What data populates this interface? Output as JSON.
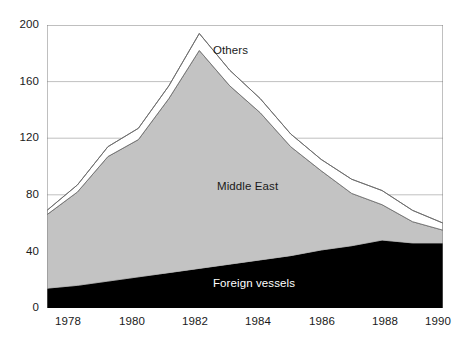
{
  "chart_data": {
    "type": "area",
    "stacked": true,
    "title": "",
    "subtitle": "",
    "xlabel": "",
    "ylabel": "",
    "xlim": [
      1977,
      1990
    ],
    "ylim": [
      0,
      200
    ],
    "yticks": [
      0,
      40,
      80,
      120,
      160,
      200
    ],
    "xticks": [
      1978,
      1980,
      1982,
      1984,
      1986,
      1988,
      1990
    ],
    "grid": true,
    "grid_axis": "y",
    "legend_position": "inline-annotations",
    "x": [
      1977,
      1978,
      1979,
      1980,
      1981,
      1982,
      1983,
      1984,
      1985,
      1986,
      1987,
      1988,
      1989,
      1990
    ],
    "series": [
      {
        "name": "Foreign vessels",
        "color": "#000000",
        "values": [
          14,
          16,
          19,
          22,
          25,
          28,
          31,
          34,
          37,
          41,
          44,
          48,
          46,
          46
        ]
      },
      {
        "name": "Middle East",
        "color": "#c3c3c3",
        "values": [
          52,
          66,
          88,
          97,
          123,
          154,
          126,
          104,
          77,
          56,
          37,
          25,
          15,
          9
        ]
      },
      {
        "name": "Others",
        "color": "#ffffff",
        "values": [
          3,
          5,
          7,
          8,
          9,
          12,
          11,
          10,
          9,
          8,
          10,
          10,
          8,
          5
        ]
      }
    ],
    "totals": [
      69,
      87,
      114,
      127,
      157,
      194,
      168,
      148,
      123,
      105,
      91,
      83,
      69,
      60
    ],
    "annotations": [
      {
        "label": "Others",
        "x": 1983,
        "y": 172
      },
      {
        "label": "Middle East",
        "x": 1983,
        "y": 83
      },
      {
        "label": "Foreign vessels",
        "x": 1983,
        "y": 18
      }
    ]
  },
  "axes": {
    "y_ticks": [
      "200",
      "160",
      "120",
      "80",
      "40",
      "0"
    ],
    "x_ticks": [
      "1978",
      "1980",
      "1982",
      "1984",
      "1986",
      "1988",
      "1990"
    ]
  },
  "labels": {
    "others": "Others",
    "middle_east": "Middle East",
    "foreign_vessels": "Foreign vessels"
  },
  "colors": {
    "foreign_vessels": "#000000",
    "middle_east": "#c3c3c3",
    "others": "#ffffff",
    "axis": "#808080",
    "grid": "#b0b0b0",
    "text": "#1a1a1a"
  }
}
